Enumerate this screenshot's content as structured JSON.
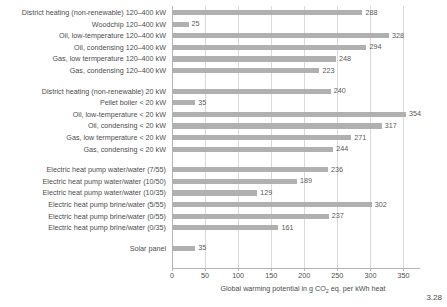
{
  "figure": {
    "number": "3.28"
  },
  "chart_data": {
    "type": "bar",
    "orientation": "horizontal",
    "title": "",
    "xlabel": "Global warming potential in g CO2 eq. per kWh heat",
    "xlabel_parts": {
      "before": "Global warming potential in g CO",
      "sub": "2",
      "after": " eq. per kWh heat"
    },
    "ylabel": "",
    "xlim": [
      0,
      375
    ],
    "xticks": [
      0,
      50,
      100,
      150,
      200,
      250,
      300,
      350
    ],
    "xtick_labels": [
      "0",
      "50",
      "100",
      "150",
      "200",
      "250",
      "300",
      "350"
    ],
    "grid": "vertical",
    "legend": "none",
    "bar_color": "#b0b0b0",
    "groups": [
      {
        "name": "120-400 kW systems",
        "items": [
          {
            "category": "District heating (non-renewable) 120–400 kW",
            "value": 288
          },
          {
            "category": "Woodchip 120–400 kW",
            "value": 25
          },
          {
            "category": "Oil, low-temperature 120–400 kW",
            "value": 328
          },
          {
            "category": "Oil, condensing 120–400 kW",
            "value": 294
          },
          {
            "category": "Gas, low termperature 120–400 kW",
            "value": 248
          },
          {
            "category": "Gas, condensing 120–400 kW",
            "value": 223
          }
        ]
      },
      {
        "name": "< 20 kW systems",
        "items": [
          {
            "category": "District heating (non-renewable) 20 kW",
            "value": 240
          },
          {
            "category": "Pellet boiler < 20 kW",
            "value": 35
          },
          {
            "category": "Oil, low-temperature < 20 kW",
            "value": 354
          },
          {
            "category": "Oil, condensing < 20 kW",
            "value": 317
          },
          {
            "category": "Gas, low termperature < 20 kW",
            "value": 271
          },
          {
            "category": "Gas, condensing < 20 kW",
            "value": 244
          }
        ]
      },
      {
        "name": "Electric heat pumps",
        "items": [
          {
            "category": "Electric heat pump water/water (7/55)",
            "value": 236
          },
          {
            "category": "Electric heat pump water/water (10/50)",
            "value": 189
          },
          {
            "category": "Electric heat pump water/water (10/35)",
            "value": 129
          },
          {
            "category": "Electric heat pump brine/water (5/55)",
            "value": 302
          },
          {
            "category": "Electric heat pump brine/water (0/55)",
            "value": 237
          },
          {
            "category": "Electric heat pump brine/water (0/35)",
            "value": 161
          }
        ]
      },
      {
        "name": "Solar",
        "items": [
          {
            "category": "Solar panel",
            "value": 35
          }
        ]
      }
    ]
  }
}
